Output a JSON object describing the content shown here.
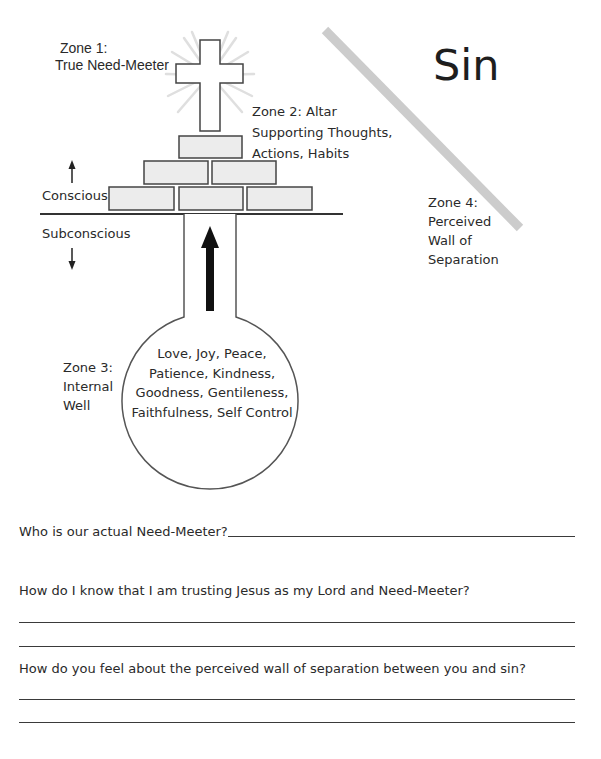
{
  "diagram": {
    "zone1": {
      "title": "Zone 1:",
      "subtitle": "True Need-Meeter"
    },
    "zone2": {
      "lines": [
        "Zone 2: Altar",
        "Supporting Thoughts,",
        "Actions, Habits"
      ]
    },
    "zone3": {
      "lines": [
        "Zone 3:",
        "Internal",
        "Well"
      ]
    },
    "zone4": {
      "lines": [
        "Zone 4:",
        "Perceived",
        "Wall of",
        "Separation"
      ]
    },
    "sin_label": "Sin",
    "conscious_label": "Conscious",
    "subconscious_label": "Subconscious",
    "well_contents": [
      "Love, Joy, Peace,",
      "Patience, Kindness,",
      "Goodness, Gentileness,",
      "Faithfulness, Self Control"
    ],
    "icons": {
      "cross": "cross-icon",
      "up_arrow": "arrow-up-icon",
      "down_arrow": "arrow-down-icon",
      "well_arrow": "arrow-up-icon"
    },
    "colors": {
      "brick_fill": "#ececec",
      "wall_stripe": "#cccccc",
      "glow": "#dcdcdc",
      "line": "#333333"
    }
  },
  "questions": [
    {
      "text": "Who is our actual Need-Meeter?",
      "answer_lines": 1
    },
    {
      "text": "How do I know that I am trusting Jesus as my Lord and Need-Meeter?",
      "answer_lines": 2
    },
    {
      "text": "How do you feel about the perceived wall of separation between you and sin?",
      "answer_lines": 2
    }
  ]
}
